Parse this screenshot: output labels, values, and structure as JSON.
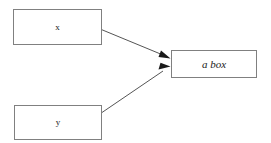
{
  "diagram": {
    "type": "flow-diagram",
    "background_color": "#ffffff",
    "border_color": "#808080",
    "arrow_color": "#555555",
    "arrowhead_color": "#1a1a1a",
    "text_color": "#1a1a1a",
    "nodes": [
      {
        "id": "x",
        "label": "x",
        "shape": "rectangle",
        "x": 13,
        "y": 9,
        "width": 89,
        "height": 36
      },
      {
        "id": "y",
        "label": "y",
        "shape": "rectangle",
        "x": 14,
        "y": 105,
        "width": 88,
        "height": 35
      },
      {
        "id": "abox",
        "label": "a box",
        "shape": "rectangle",
        "x": 171,
        "y": 50,
        "width": 86,
        "height": 28
      }
    ],
    "edges": [
      {
        "id": "x-to-abox",
        "from": "x",
        "to": "abox",
        "from_point": [
          88,
          24
        ],
        "to_point": [
          170,
          58
        ],
        "arrowhead": "filled-triangle"
      },
      {
        "id": "y-to-abox",
        "from": "y",
        "to": "abox",
        "from_point": [
          88,
          122
        ],
        "to_point": [
          170,
          67
        ],
        "arrowhead": "filled-triangle"
      }
    ]
  }
}
